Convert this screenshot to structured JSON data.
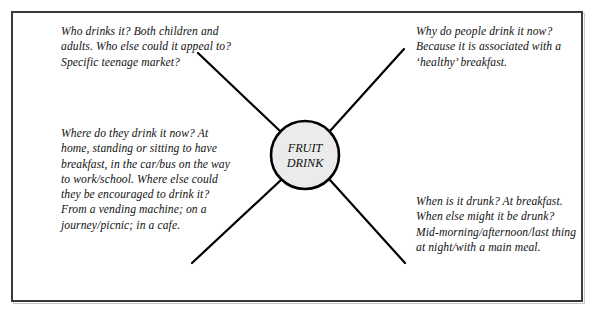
{
  "diagram": {
    "type": "spider-diagram",
    "center_node": {
      "label_line1": "FRUIT",
      "label_line2": "DRINK",
      "fill_color": "#ebebeb",
      "stroke_color": "#000000",
      "cx": 305,
      "cy": 155,
      "r": 34
    },
    "frame": {
      "border_color": "#3a3a3c"
    },
    "branches": [
      {
        "id": "who-drinks-it",
        "position": "top-left",
        "text": "Who drinks it? Both children and adults. Who else could it appeal to? Specific teenage market?"
      },
      {
        "id": "why-drink-it-now",
        "position": "top-right",
        "text": "Why do people drink it now? Because it is associated with a ‘healthy’ breakfast."
      },
      {
        "id": "where-do-they-drink-it",
        "position": "bottom-left",
        "text": "Where do they drink it now? At home, standing or sitting to have breakfast, in the car/bus on the way to work/school. Where else could they be encouraged to drink it? From a vending machine; on a journey/picnic; in a cafe."
      },
      {
        "id": "when-is-it-drunk",
        "position": "bottom-right",
        "text": "When is it drunk? At breakfast. When else might it be drunk? Mid-morning/afternoon/last thing at night/with a main meal."
      }
    ],
    "spokes": [
      {
        "id": "spoke-top-left",
        "x1": 280,
        "y1": 131,
        "x2": 198,
        "y2": 53
      },
      {
        "id": "spoke-top-right",
        "x1": 330,
        "y1": 131,
        "x2": 404,
        "y2": 49
      },
      {
        "id": "spoke-bottom-left",
        "x1": 281,
        "y1": 180,
        "x2": 192,
        "y2": 263
      },
      {
        "id": "spoke-bottom-right",
        "x1": 330,
        "y1": 180,
        "x2": 405,
        "y2": 263
      }
    ]
  }
}
